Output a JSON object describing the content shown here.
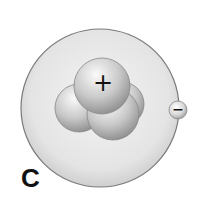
{
  "diagram": {
    "panel_label": "C",
    "nucleus": {
      "charge_symbol": "+",
      "particle_count": 4
    },
    "electron": {
      "charge_symbol": "−"
    },
    "colors": {
      "cloud_fill": "#e6e6e6",
      "cloud_edge": "#7a7a7a",
      "particle_light": "#f2f2f2",
      "particle_dark": "#8c8c8c",
      "symbol": "#111111"
    }
  }
}
